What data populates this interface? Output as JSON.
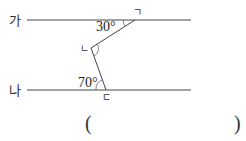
{
  "lines": {
    "top": {
      "label": "가"
    },
    "bottom": {
      "label": "나"
    }
  },
  "points": {
    "top": {
      "label": "ㄱ"
    },
    "middle": {
      "label": "ㄴ"
    },
    "bottom": {
      "label": "ㄷ"
    }
  },
  "angles": {
    "top": "30°",
    "bottom": "70°"
  },
  "answer": {
    "open": "(",
    "close": ")"
  }
}
